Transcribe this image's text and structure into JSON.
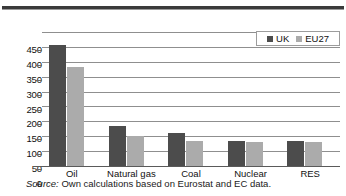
{
  "figure": {
    "source_note_label": "Source:",
    "source_note_text": " Own calculations based on Eurostat and EC data."
  },
  "legend": {
    "position": "top-right",
    "entries": [
      {
        "label": "UK",
        "color": "#4c4c4c",
        "swatch_name": "legend-swatch-uk"
      },
      {
        "label": "EU27",
        "color": "#ababab",
        "swatch_name": "legend-swatch-eu27"
      }
    ]
  },
  "chart_data": {
    "type": "bar",
    "title": "",
    "subtitle": "",
    "xlabel": "",
    "ylabel": "",
    "categories": [
      "Oil",
      "Natural gas",
      "Coal",
      "Nuclear",
      "RES"
    ],
    "series": [
      {
        "name": "UK",
        "color": "#4c4c4c",
        "values": [
          405,
          135,
          112,
          84,
          84
        ]
      },
      {
        "name": "EU27",
        "color": "#ababab",
        "values": [
          334,
          100,
          84,
          80,
          79
        ]
      }
    ],
    "ylim": [
      0,
      450
    ],
    "yticks": [
      0,
      50,
      100,
      150,
      200,
      250,
      300,
      350,
      400,
      450
    ],
    "ytick_labels": [
      "0",
      "50",
      "100",
      "150",
      "200",
      "250",
      "300",
      "350",
      "400",
      "450"
    ],
    "grid": true,
    "grid_axis": "y",
    "legend_position": "top-right",
    "annotations": []
  }
}
